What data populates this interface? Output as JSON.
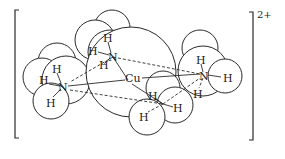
{
  "figure": {
    "species": "tetraamminecopper(II) complex ion",
    "charge_label": "2+",
    "central_atom": {
      "label": "Cu",
      "x": 133,
      "y": 82
    },
    "ligands": [
      {
        "name": "ammonia-top",
        "n_label": "N",
        "n": {
          "x": 113,
          "y": 57
        },
        "hydrogens": [
          {
            "label": "H",
            "x": 107,
            "y": 38
          },
          {
            "label": "H",
            "x": 92,
            "y": 51
          },
          {
            "label": "H",
            "x": 103,
            "y": 65
          }
        ]
      },
      {
        "name": "ammonia-left",
        "n_label": "N",
        "n": {
          "x": 63,
          "y": 87
        },
        "hydrogens": [
          {
            "label": "H",
            "x": 56,
            "y": 69
          },
          {
            "label": "H",
            "x": 43,
            "y": 80
          },
          {
            "label": "H",
            "x": 50,
            "y": 103
          }
        ]
      },
      {
        "name": "ammonia-right",
        "n_label": "N",
        "n": {
          "x": 204,
          "y": 76
        },
        "hydrogens": [
          {
            "label": "H",
            "x": 200,
            "y": 60
          },
          {
            "label": "H",
            "x": 227,
            "y": 78
          },
          {
            "label": "H",
            "x": 197,
            "y": 94
          }
        ]
      },
      {
        "name": "ammonia-bottom",
        "n_label": "",
        "hydrogens": [
          {
            "label": "H",
            "x": 152,
            "y": 96
          },
          {
            "label": "H",
            "x": 177,
            "y": 108
          },
          {
            "label": "H",
            "x": 143,
            "y": 117
          }
        ]
      }
    ]
  }
}
